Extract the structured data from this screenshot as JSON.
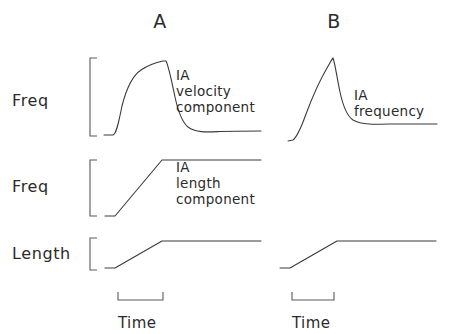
{
  "figure": {
    "background": "#ffffff",
    "stroke_color": "#3a3a3a",
    "bracket_color": "#5a5a5a",
    "text_color": "#2b2b2b",
    "width": 451,
    "height": 334
  },
  "panels": [
    {
      "id": "A",
      "label": "A",
      "x": 160,
      "y": 28
    },
    {
      "id": "B",
      "label": "B",
      "x": 334,
      "y": 28
    }
  ],
  "row_labels": [
    {
      "id": "freq-velocity",
      "text": "Freq",
      "x": 12,
      "y": 106
    },
    {
      "id": "freq-length",
      "text": "Freq",
      "x": 12,
      "y": 192
    },
    {
      "id": "length",
      "text": "Length",
      "x": 12,
      "y": 259
    }
  ],
  "annotations": [
    {
      "id": "ia-velocity-component",
      "lines": [
        "IA",
        "velocity",
        "component"
      ],
      "x": 176,
      "y": 80,
      "line_height": 16
    },
    {
      "id": "ia-length-component",
      "lines": [
        "IA",
        "length",
        "component"
      ],
      "x": 176,
      "y": 172,
      "line_height": 16
    },
    {
      "id": "ia-frequency",
      "lines": [
        "IA",
        "frequency"
      ],
      "x": 354,
      "y": 100,
      "line_height": 16
    }
  ],
  "time_axes": [
    {
      "id": "time-axis-a",
      "label": "Time",
      "label_x": 118,
      "label_y": 328,
      "path": "M 118 292 L 118 300 L 163 300 L 163 292"
    },
    {
      "id": "time-axis-b",
      "label": "Time",
      "label_x": 292,
      "label_y": 328,
      "path": "M 292 292 L 292 300 L 334 300 L 334 292"
    }
  ],
  "y_brackets": [
    {
      "id": "y-bracket-freq-velocity",
      "path": "M 97 58 L 90 58 L 90 136 L 97 136"
    },
    {
      "id": "y-bracket-freq-length",
      "path": "M 97 160 L 90 160 L 90 216 L 97 216"
    },
    {
      "id": "y-bracket-length",
      "path": "M 97 238 L 90 238 L 90 270 L 97 270"
    },
    {
      "id": "y-bracket-b-dummy",
      "path": ""
    }
  ],
  "chart_data": {
    "type": "line",
    "xlabel": "Time",
    "grid": false,
    "legend": null,
    "panels": [
      {
        "panel": "A",
        "description": "IA response decomposed into velocity and length components",
        "traces": [
          {
            "name": "IA velocity component",
            "ylabel": "Freq",
            "baseline_y": 135,
            "peak_y": 60,
            "ramp_start_x": 112,
            "ramp_end_x": 162,
            "plateau_end_x": 260,
            "final_y": 131,
            "shape": "fast rise to rounded plateau during ramp, sharp fall at ramp end, exponential decay to slightly raised baseline",
            "path": "M 104 135 L 113 135 C 117 133 119 120 122 106 C 126 90 132 76 141 70 C 150 64 158 62 163 61 L 166 61 C 169 67 172 83 175 97 C 178 111 182 122 188 127 C 196 133 208 132 220 131.5 C 234 131 248 131 261 131"
          },
          {
            "name": "IA length component",
            "ylabel": "Freq",
            "baseline_y": 216,
            "plateau_y": 160,
            "ramp_start_x": 115,
            "ramp_end_x": 162,
            "plateau_end_x": 261,
            "shape": "flat baseline, linear ramp up during stretch, flat elevated plateau",
            "path": "M 105 216 L 115 216 L 162 160 L 261 160"
          },
          {
            "name": "Length",
            "ylabel": "Length",
            "baseline_y": 268,
            "plateau_y": 241,
            "ramp_start_x": 115,
            "ramp_end_x": 162,
            "plateau_end_x": 261,
            "shape": "flat baseline, linear ramp, flat hold",
            "path": "M 105 268 L 115 268 L 162 241 L 261 241"
          }
        ]
      },
      {
        "panel": "B",
        "description": "Combined IA frequency response (sum of velocity and length components)",
        "traces": [
          {
            "name": "IA frequency",
            "ylabel": "Freq",
            "baseline_y": 141,
            "peak_x": 332,
            "peak_y": 58,
            "plateau_end_x": 436,
            "final_y": 124,
            "shape": "steep accelerating rise to sharp peak at end of ramp, then rapid exponential decay to raised plateau",
            "path": "M 288 141 L 293 140 C 297 137 301 128 306 114 C 312 98 320 80 327 68 C 330 63 332 59 333 58 C 335 63 337 78 340 92 C 343 106 347 116 353 120 C 362 125 375 124.5 388 124 C 404 124 420 124 437 124"
          },
          {
            "name": "Length",
            "ylabel": "Length",
            "baseline_y": 268,
            "plateau_y": 241,
            "ramp_start_x": 290,
            "ramp_end_x": 337,
            "plateau_end_x": 436,
            "shape": "flat baseline, linear ramp, flat hold",
            "path": "M 280 268 L 290 268 L 337 241 L 436 241"
          }
        ]
      }
    ]
  }
}
